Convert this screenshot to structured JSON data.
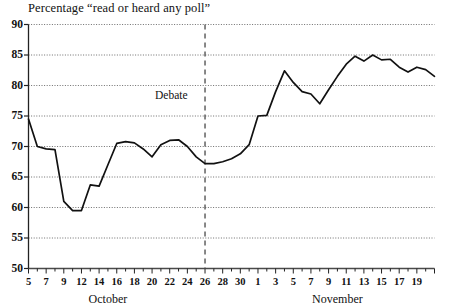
{
  "chart_data": {
    "type": "line",
    "title": "Percentage “read or heard any poll”",
    "xlabel": "",
    "ylabel": "",
    "ylim": [
      50,
      90
    ],
    "yticks": [
      50,
      55,
      60,
      65,
      70,
      75,
      80,
      85,
      90
    ],
    "grid": true,
    "legend": null,
    "axis_groups": [
      {
        "name": "October",
        "ticks": [
          "5",
          "7",
          "9",
          "12",
          "14",
          "16",
          "18",
          "20",
          "22",
          "24",
          "26",
          "28",
          "30"
        ]
      },
      {
        "name": "November",
        "ticks": [
          "1",
          "3",
          "5",
          "7",
          "9",
          "11",
          "13",
          "15",
          "17",
          "19"
        ]
      }
    ],
    "xticklabels": [
      "5",
      "7",
      "9",
      "12",
      "14",
      "16",
      "18",
      "20",
      "22",
      "24",
      "26",
      "28",
      "30",
      "1",
      "3",
      "5",
      "7",
      "9",
      "11",
      "13",
      "15",
      "17",
      "19"
    ],
    "annotations": [
      {
        "text": "Debate",
        "x": "25",
        "kind": "vertical-dashed-line"
      }
    ],
    "series": [
      {
        "name": "read or heard any poll",
        "color": "#111111",
        "x": [
          "Oct 5",
          "Oct 6",
          "Oct 7",
          "Oct 8",
          "Oct 9",
          "Oct 10",
          "Oct 11",
          "Oct 12",
          "Oct 13",
          "Oct 14",
          "Oct 15",
          "Oct 16",
          "Oct 17",
          "Oct 18",
          "Oct 19",
          "Oct 20",
          "Oct 21",
          "Oct 22",
          "Oct 23",
          "Oct 24",
          "Oct 25",
          "Oct 26",
          "Oct 27",
          "Oct 28",
          "Oct 29",
          "Oct 30",
          "Oct 31",
          "Nov 1",
          "Nov 2",
          "Nov 3",
          "Nov 4",
          "Nov 5",
          "Nov 6",
          "Nov 7",
          "Nov 8",
          "Nov 9",
          "Nov 10",
          "Nov 11",
          "Nov 12",
          "Nov 13",
          "Nov 14",
          "Nov 15",
          "Nov 16",
          "Nov 17",
          "Nov 18",
          "Nov 19",
          "Nov 20"
        ],
        "values": [
          74.5,
          70.0,
          69.6,
          69.5,
          61.0,
          59.5,
          59.5,
          63.7,
          63.5,
          67.0,
          70.5,
          70.8,
          70.6,
          69.6,
          68.3,
          70.3,
          71.0,
          71.1,
          70.0,
          68.3,
          67.2,
          67.2,
          67.5,
          68.0,
          68.8,
          70.3,
          75.0,
          75.1,
          79.0,
          82.4,
          80.5,
          79.0,
          78.6,
          77.0,
          79.3,
          81.5,
          83.5,
          84.8,
          84.0,
          85.0,
          84.2,
          84.3,
          83.0,
          82.2,
          83.0,
          82.6,
          81.5
        ]
      }
    ]
  }
}
